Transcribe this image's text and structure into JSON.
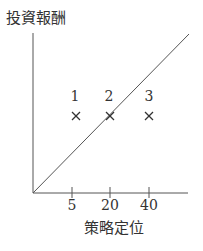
{
  "diagram": {
    "y_axis_label": "投資報酬",
    "x_axis_label": "策略定位",
    "x_ticks": [
      "5",
      "20",
      "40"
    ],
    "points": [
      {
        "label": "1",
        "marker": "×"
      },
      {
        "label": "2",
        "marker": "×"
      },
      {
        "label": "3",
        "marker": "×"
      }
    ],
    "line_color": "#555555"
  }
}
